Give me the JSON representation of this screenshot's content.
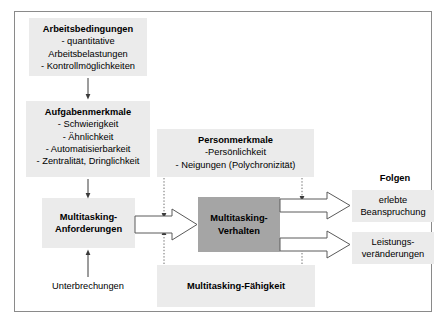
{
  "diagram": {
    "title_visible": false,
    "boxes": {
      "arbeitsbedingungen": {
        "title": "Arbeitsbedingungen",
        "lines": [
          "- quantitative",
          "Arbeitsbelastungen",
          "- Kontrollmöglichkeiten"
        ]
      },
      "aufgabenmerkmale": {
        "title": "Aufgabenmerkmale",
        "lines": [
          "- Schwierigkeit",
          "- Ähnlichkeit",
          "- Automatisierbarkeit",
          "- Zentralität, Dringlichkeit"
        ]
      },
      "personmerkmale": {
        "title": "Personmerkmale",
        "lines": [
          "-Persönlichkeit",
          "- Neigungen (Polychronizität)"
        ]
      },
      "multitasking_anforderungen": {
        "line1": "Multitasking-",
        "line2": "Anforderungen"
      },
      "multitasking_verhalten": {
        "line1": "Multitasking-",
        "line2": "Verhalten"
      },
      "multitasking_faehigkeit": {
        "title": "Multitasking-Fähigkeit"
      },
      "unterbrechungen": {
        "label": "Unterbrechungen"
      },
      "folgen": {
        "heading": "Folgen",
        "outcome1_line1": "erlebte",
        "outcome1_line2": "Beanspruchung",
        "outcome2_line1": "Leistungs-",
        "outcome2_line2": "veränderungen"
      }
    },
    "colors": {
      "light_box": "#ebebeb",
      "dark_box": "#a5a5a5",
      "frame_border": "#8a8a8a",
      "arrow_stroke": "#555555",
      "connector": "#444444",
      "background": "#ffffff"
    }
  }
}
